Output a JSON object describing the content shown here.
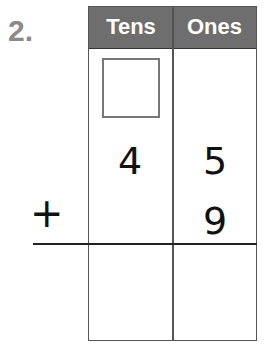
{
  "problem": {
    "number": "2.",
    "columns": [
      {
        "label": "Tens"
      },
      {
        "label": "Ones"
      }
    ],
    "regroup_box": "",
    "addend_top": {
      "tens": "4",
      "ones": "5"
    },
    "addend_bottom": {
      "tens": "",
      "ones": "9"
    },
    "operator": "+",
    "answer": {
      "tens": "",
      "ones": ""
    }
  },
  "colors": {
    "header_bg": "#6e6e6e",
    "header_text": "#ffffff",
    "problem_number": "#8a8a8a",
    "border": "#555555"
  }
}
